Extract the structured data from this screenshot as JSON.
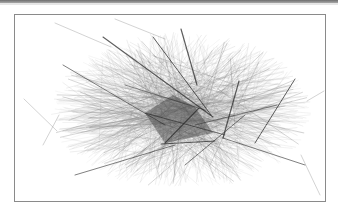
{
  "figure": {
    "type": "network-graph",
    "colors": {
      "background": "#ffffff",
      "frame_border": "#8a8a8a",
      "top_rule": "#6e6e6e",
      "light_edge": "#8c8c8c",
      "mid_edge": "#5a5a5a",
      "dark_edge": "#2a2a2a",
      "core": "#3a3a3a"
    },
    "frame": {
      "x": 14,
      "y": 14,
      "width": 310,
      "height": 186
    },
    "cloud": {
      "center_x": 166,
      "center_y": 96,
      "radius_x": 118,
      "radius_y": 72,
      "edge_count": 900,
      "seed": 7
    },
    "core_polygon": [
      [
        130,
        98
      ],
      [
        158,
        80
      ],
      [
        180,
        92
      ],
      [
        198,
        118
      ],
      [
        150,
        128
      ]
    ],
    "prominent_edges": [
      {
        "x1": 88,
        "y1": 22,
        "x2": 198,
        "y2": 102,
        "w": 1.1
      },
      {
        "x1": 138,
        "y1": 22,
        "x2": 196,
        "y2": 100,
        "w": 1.0
      },
      {
        "x1": 166,
        "y1": 14,
        "x2": 182,
        "y2": 70,
        "w": 1.2
      },
      {
        "x1": 224,
        "y1": 66,
        "x2": 208,
        "y2": 123,
        "w": 1.2
      },
      {
        "x1": 280,
        "y1": 64,
        "x2": 240,
        "y2": 128,
        "w": 1.0
      },
      {
        "x1": 146,
        "y1": 129,
        "x2": 200,
        "y2": 126,
        "w": 1.1
      },
      {
        "x1": 150,
        "y1": 128,
        "x2": 184,
        "y2": 93,
        "w": 1.1
      },
      {
        "x1": 130,
        "y1": 98,
        "x2": 210,
        "y2": 120,
        "w": 0.9
      },
      {
        "x1": 48,
        "y1": 50,
        "x2": 150,
        "y2": 110,
        "w": 0.8
      },
      {
        "x1": 60,
        "y1": 160,
        "x2": 160,
        "y2": 130,
        "w": 0.8
      },
      {
        "x1": 170,
        "y1": 150,
        "x2": 230,
        "y2": 100,
        "w": 0.8
      },
      {
        "x1": 208,
        "y1": 123,
        "x2": 290,
        "y2": 150,
        "w": 0.8
      },
      {
        "x1": 110,
        "y1": 70,
        "x2": 190,
        "y2": 95,
        "w": 0.7
      },
      {
        "x1": 180,
        "y1": 110,
        "x2": 262,
        "y2": 90,
        "w": 0.7
      }
    ],
    "stray_edges": [
      {
        "x1": 9,
        "y1": 84,
        "x2": 42,
        "y2": 116
      },
      {
        "x1": 28,
        "y1": 130,
        "x2": 44,
        "y2": 100
      },
      {
        "x1": 40,
        "y1": 8,
        "x2": 96,
        "y2": 32
      },
      {
        "x1": 100,
        "y1": 4,
        "x2": 150,
        "y2": 24
      },
      {
        "x1": 286,
        "y1": 140,
        "x2": 305,
        "y2": 180
      },
      {
        "x1": 292,
        "y1": 86,
        "x2": 309,
        "y2": 76
      }
    ]
  }
}
